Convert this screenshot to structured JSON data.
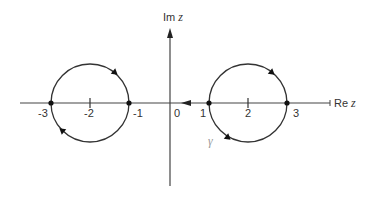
{
  "figure": {
    "axes": {
      "real_label_prefix": "Re",
      "real_label_var": "z",
      "imag_label_prefix": "Im",
      "imag_label_var": "z",
      "origin_label": "0"
    },
    "tick_labels": {
      "neg3": "-3",
      "neg2": "-2",
      "neg1": "-1",
      "pos1": "1",
      "pos2": "2",
      "pos3": "3"
    },
    "contour_label": "γ",
    "circles": [
      {
        "name": "left-circle",
        "center": -2,
        "radius": 1,
        "marked_points": [
          -3,
          -1
        ]
      },
      {
        "name": "right-circle",
        "center": 2,
        "radius": 1,
        "marked_points": [
          1,
          3
        ]
      }
    ],
    "colors": {
      "line": "#333333",
      "gamma": "#9a9a9a"
    }
  }
}
